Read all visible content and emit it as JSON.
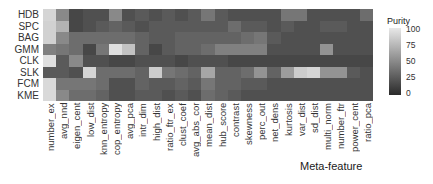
{
  "chart_data": {
    "type": "heatmap",
    "title": "",
    "xlabel": "Meta-feature",
    "ylabel": "",
    "rows": [
      "HDB",
      "SPC",
      "BAG",
      "GMM",
      "CLK",
      "SLK",
      "FCM",
      "KME"
    ],
    "columns": [
      "number_ex",
      "avg_nnd",
      "eigen_cent",
      "low_dist",
      "knn_entropy",
      "cop_entropy",
      "avg_pca",
      "intr_dim",
      "high_dist",
      "ratio_ftr_ex",
      "clust_coef",
      "avg_abs_cor",
      "mean_dist",
      "hub_score",
      "contrast",
      "skewness",
      "perc_out",
      "net_dens",
      "kurtosis",
      "var_dist",
      "sd_dist",
      "multi_norm",
      "number_ftr",
      "power_cent",
      "ratio_pca"
    ],
    "values": [
      [
        90,
        50,
        15,
        20,
        20,
        50,
        20,
        25,
        20,
        25,
        20,
        25,
        40,
        25,
        20,
        20,
        20,
        20,
        40,
        40,
        20,
        20,
        20,
        20,
        35
      ],
      [
        88,
        72,
        15,
        20,
        25,
        30,
        25,
        20,
        25,
        25,
        25,
        25,
        25,
        25,
        35,
        25,
        25,
        20,
        25,
        20,
        20,
        25,
        25,
        20,
        20
      ],
      [
        88,
        50,
        35,
        35,
        35,
        35,
        35,
        30,
        25,
        25,
        30,
        30,
        30,
        30,
        30,
        35,
        40,
        25,
        20,
        20,
        20,
        20,
        20,
        20,
        20
      ],
      [
        45,
        40,
        35,
        15,
        40,
        95,
        80,
        30,
        15,
        25,
        30,
        30,
        35,
        45,
        45,
        45,
        45,
        20,
        20,
        20,
        20,
        55,
        20,
        20,
        20
      ],
      [
        95,
        25,
        50,
        20,
        20,
        15,
        15,
        20,
        20,
        20,
        15,
        20,
        20,
        20,
        15,
        15,
        15,
        15,
        15,
        15,
        15,
        15,
        15,
        15,
        15
      ],
      [
        25,
        25,
        20,
        90,
        35,
        35,
        35,
        30,
        85,
        40,
        35,
        30,
        65,
        30,
        30,
        35,
        55,
        30,
        60,
        85,
        90,
        55,
        55,
        25,
        20
      ],
      [
        92,
        40,
        40,
        40,
        35,
        20,
        20,
        30,
        25,
        25,
        30,
        25,
        40,
        30,
        30,
        25,
        25,
        20,
        20,
        20,
        20,
        20,
        20,
        20,
        20
      ],
      [
        92,
        50,
        35,
        35,
        30,
        20,
        20,
        25,
        25,
        20,
        25,
        20,
        35,
        30,
        25,
        20,
        20,
        20,
        20,
        20,
        20,
        20,
        20,
        20,
        20
      ]
    ],
    "legend": {
      "title": "Purity",
      "ticks": [
        100,
        75,
        50,
        25,
        0
      ],
      "range": [
        0,
        100
      ],
      "position": "right"
    },
    "colormap": {
      "low": "#2a2a2a",
      "high": "#e8e8e8"
    },
    "grid": false
  },
  "legend": {
    "title": "Purity",
    "ticks": [
      "100",
      "75",
      "50",
      "25",
      "0"
    ]
  },
  "axis": {
    "x_title": "Meta-feature"
  }
}
